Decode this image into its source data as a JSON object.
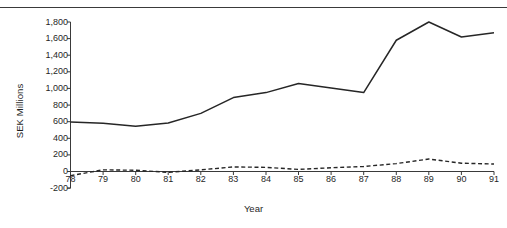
{
  "chart_data": {
    "type": "line",
    "title": "",
    "xlabel": "Year",
    "ylabel": "SEK Millions",
    "x": [
      78,
      79,
      80,
      81,
      82,
      83,
      84,
      85,
      86,
      87,
      88,
      89,
      90,
      91
    ],
    "xtick_labels": [
      "78",
      "79",
      "80",
      "81",
      "82",
      "83",
      "84",
      "85",
      "86",
      "87",
      "88",
      "89",
      "90",
      "91"
    ],
    "ytick_labels": [
      "1,800",
      "1,600",
      "1,400",
      "1,200",
      "1,000",
      "800",
      "600",
      "400",
      "200",
      "0",
      "-200"
    ],
    "ytick_values": [
      1800,
      1600,
      1400,
      1200,
      1000,
      800,
      600,
      400,
      200,
      0,
      -200
    ],
    "ylim": [
      -200,
      1800
    ],
    "xlim": [
      78,
      91
    ],
    "grid": false,
    "legend": "none",
    "series": [
      {
        "name": "solid-series",
        "style": "solid",
        "color": "#262626",
        "values": [
          595,
          580,
          545,
          585,
          700,
          890,
          950,
          1060,
          1005,
          950,
          1580,
          1800,
          1620,
          1670
        ]
      },
      {
        "name": "dashed-series",
        "style": "dashed",
        "color": "#262626",
        "values": [
          -50,
          20,
          15,
          -10,
          20,
          55,
          50,
          25,
          45,
          60,
          95,
          150,
          100,
          90
        ]
      }
    ]
  },
  "axis": {
    "ylabel_text": "SEK Millions",
    "xlabel_text": "Year"
  }
}
